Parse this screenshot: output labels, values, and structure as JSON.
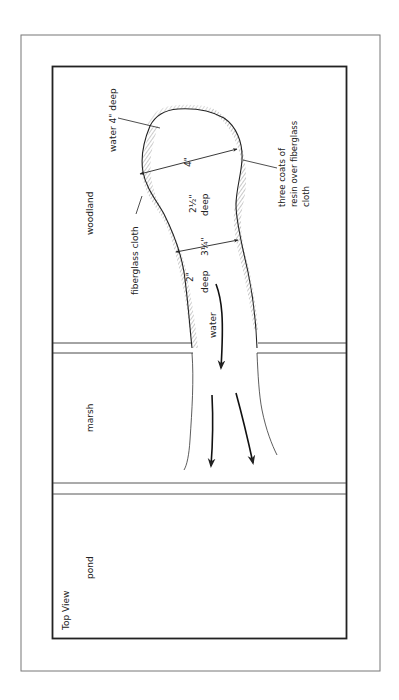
{
  "figure": {
    "view_label": "Top View",
    "zones": {
      "woodland": "woodland",
      "marsh": "marsh",
      "pond": "pond"
    },
    "annotations": {
      "water_depth_head": "water 4\" deep",
      "width_head": "4\"",
      "depth_middle_value": "2½\"",
      "depth_middle_unit": "deep",
      "width_neck": "3¼\"",
      "depth_neck_value": "2\"",
      "depth_neck_unit": "deep",
      "flow_label": "water",
      "liner_left": "fiberglass cloth",
      "liner_right_line1": "three coats of",
      "liner_right_line2": "resin over fiberglass",
      "liner_right_line3": "cloth"
    },
    "colors": {
      "ink": "#222222",
      "frame": "#777777",
      "background": "#ffffff"
    }
  }
}
